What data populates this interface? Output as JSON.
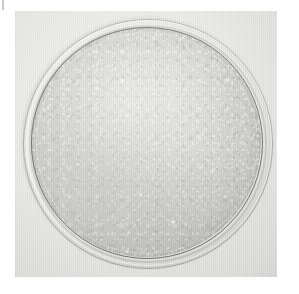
{
  "page": {
    "background_color": "#ffffff",
    "width": 299,
    "height": 294
  },
  "corner_mark": {
    "name": "crop-tick-mark",
    "color": "#c9c9c9"
  },
  "photograph": {
    "subject": "petri-dish-bacterial-culture",
    "rendering": "grayscale halftone print scan",
    "background_color": "#e9e9e7",
    "frame": {
      "left": 15,
      "top": 11,
      "width": 262,
      "height": 266
    }
  },
  "petri_dish": {
    "outer_rim": {
      "name": "dish-outer-wall",
      "color": "#cecec9",
      "edge_color": "#787874"
    },
    "highlight_ring": {
      "name": "dish-rim-highlight",
      "color": "#ffffff"
    },
    "agar": {
      "name": "agar-medium",
      "fill_color": "#c9c9c5",
      "edge_color": "#484844"
    },
    "colonies": {
      "name": "bacterial-colony-field",
      "appearance": "dense confluent granular lawn",
      "highlight_color": "#ffffff",
      "shadow_color": "#919191",
      "dense_regions": [
        "lower-left",
        "lower-right",
        "left-middle"
      ]
    },
    "notable_spots": [
      {
        "cx_pct": 63,
        "cy_pct": 86,
        "size": 5
      },
      {
        "cx_pct": 40,
        "cy_pct": 24,
        "size": 4
      },
      {
        "cx_pct": 79,
        "cy_pct": 63,
        "size": 4
      },
      {
        "cx_pct": 21,
        "cy_pct": 60,
        "size": 3
      }
    ]
  }
}
